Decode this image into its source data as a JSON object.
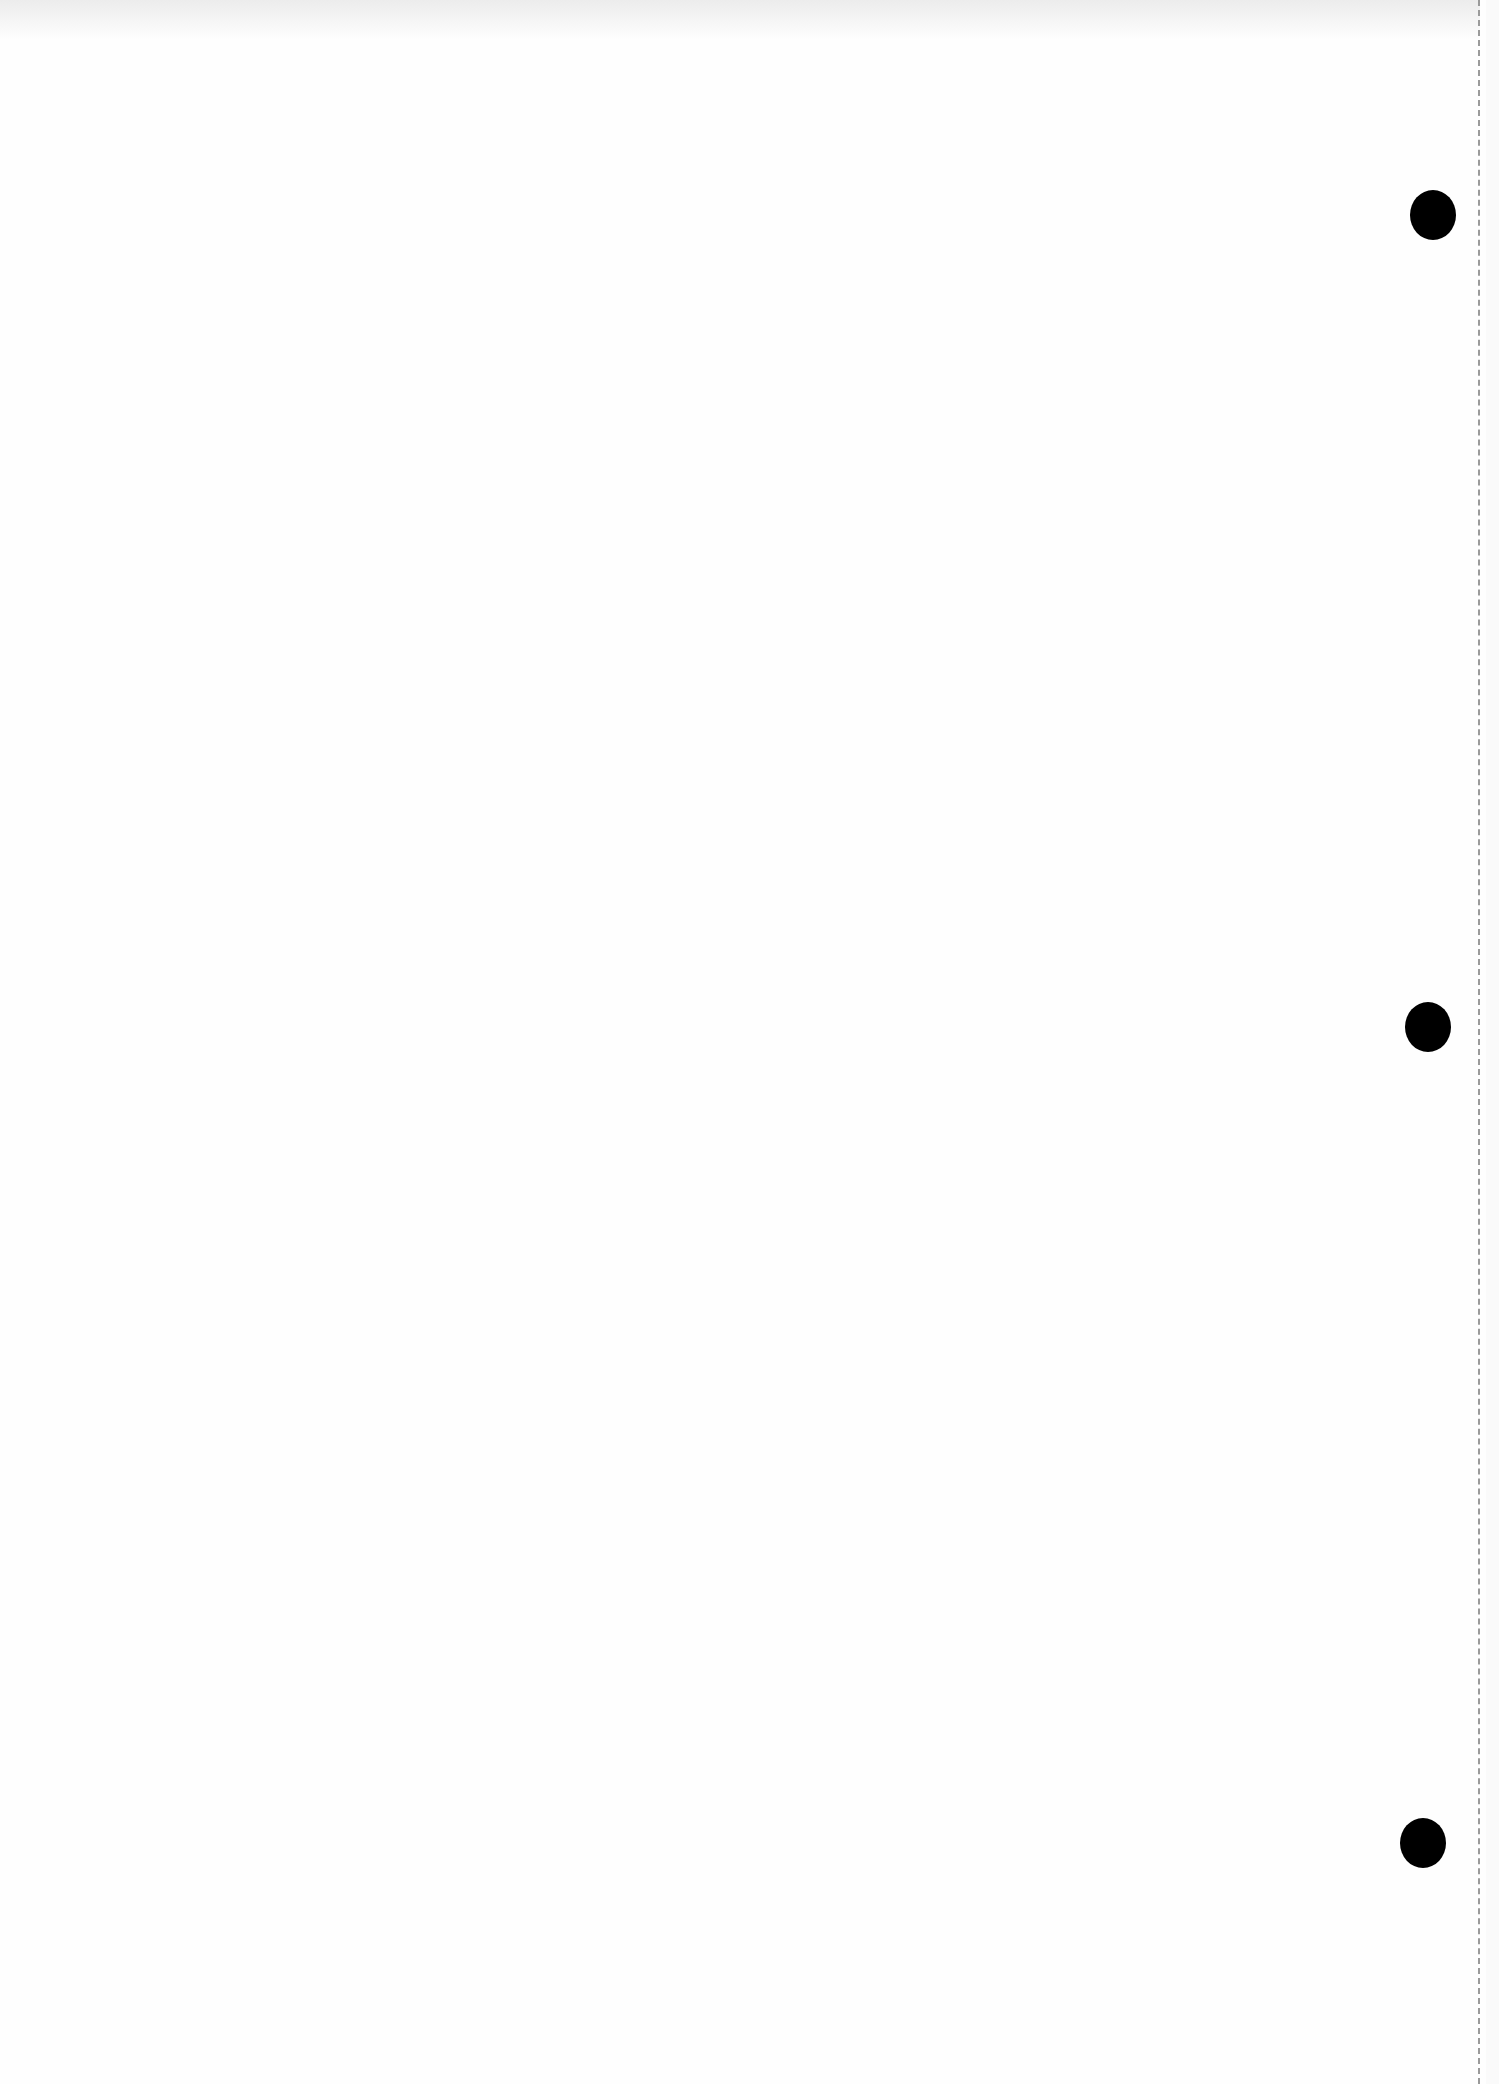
{
  "page": {
    "type": "blank scanned sheet",
    "punch_holes": [
      {
        "x": 1433,
        "y": 215
      },
      {
        "x": 1428,
        "y": 1027
      },
      {
        "x": 1423,
        "y": 1843
      }
    ],
    "colors": {
      "paper": "#fefefe",
      "hole": "#000000",
      "edge": "#9a9a9a"
    }
  }
}
